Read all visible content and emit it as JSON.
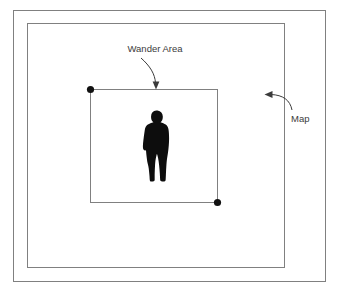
{
  "diagram": {
    "background_color": "#ffffff",
    "stroke_color": "#808080",
    "marker_color": "#111111",
    "text_color": "#3b3b3b",
    "frames": {
      "outer_border": {
        "name": "outer-frame",
        "x": 13.5,
        "y": 10.5,
        "width": 312,
        "height": 271
      },
      "map_rect": {
        "name": "map-rectangle",
        "label": "Map",
        "x": 27.5,
        "y": 23.5,
        "width": 257,
        "height": 244
      },
      "wander_rect": {
        "name": "wander-area-rectangle",
        "label": "Wander Area",
        "x": 90.5,
        "y": 89.5,
        "width": 127,
        "height": 113
      }
    },
    "corner_markers": [
      {
        "name": "wander-area-top-left-handle",
        "cx": 90.5,
        "cy": 89.5,
        "r": 3.6
      },
      {
        "name": "wander-area-bottom-right-handle",
        "cx": 217.5,
        "cy": 202.5,
        "r": 3.6
      }
    ],
    "actor": {
      "name": "person-silhouette",
      "description": "standing man in suit",
      "color": "#0d0d0d",
      "x": 140,
      "y": 110,
      "width": 32,
      "height": 72
    },
    "annotations": [
      {
        "id": "wander-area",
        "label": "Wander Area",
        "label_x": 155,
        "label_y": 52,
        "label_anchor": "middle",
        "font_size": 9.5,
        "arrow_path": "M 141 58 C 150 66, 155 74, 155.5 83",
        "arrow_head": "156 89.5 152.6 81.5 159.4 81.5"
      },
      {
        "id": "map",
        "label": "Map",
        "label_x": 291,
        "label_y": 122,
        "label_anchor": "start",
        "font_size": 9.5,
        "arrow_path": "M 292 110 C 290 100, 283 95, 271 94.5",
        "arrow_head": "264.5 94.5 272.5 91.1 272.5 97.9"
      }
    ]
  }
}
